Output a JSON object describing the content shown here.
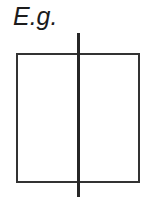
{
  "figure": {
    "caption": "E.g.",
    "background_color": "#ffffff",
    "stroke_color": "#333333",
    "width": 146,
    "height": 197
  },
  "diagram_data": {
    "type": "line-drawing",
    "description": "A rectangle bisected vertically by a line that overshoots above and below the rectangle",
    "shapes": [
      {
        "name": "outer-rectangle",
        "kind": "rect",
        "x": 16,
        "y": 53,
        "width": 123,
        "height": 129,
        "stroke": "#333333",
        "stroke_width": 2,
        "fill": "none"
      },
      {
        "name": "vertical-bisector",
        "kind": "line",
        "x1": 78.5,
        "y1": 33,
        "x2": 78.5,
        "y2": 197,
        "stroke": "#262626",
        "stroke_width": 3
      }
    ]
  }
}
